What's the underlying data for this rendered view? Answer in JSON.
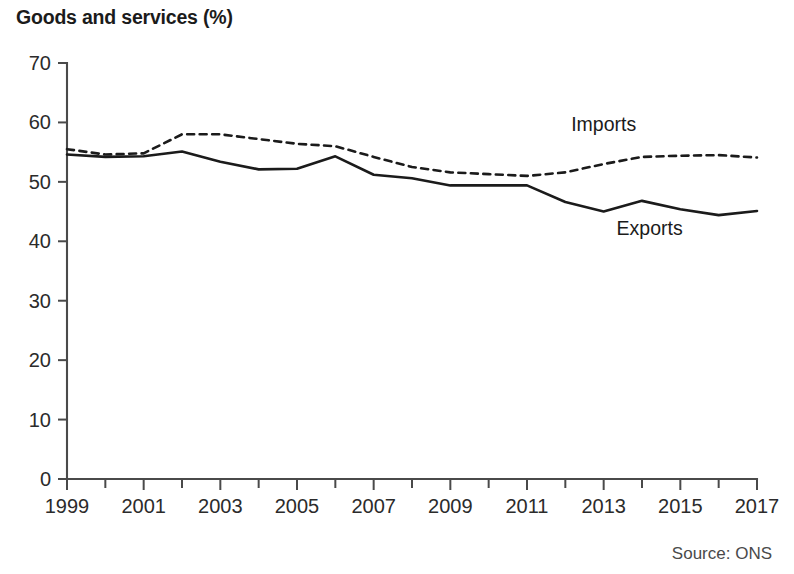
{
  "chart_data": {
    "type": "line",
    "title": "Goods and services (%)",
    "subtitle": "",
    "xlabel": "",
    "ylabel": "",
    "source": "Source: ONS",
    "grid": false,
    "legend_position": "inline-annotations",
    "xlim": [
      1999,
      2017
    ],
    "ylim": [
      0,
      70
    ],
    "yticks": [
      0,
      10,
      20,
      30,
      40,
      50,
      60,
      70
    ],
    "ytick_labels": [
      "0",
      "10",
      "20",
      "30",
      "40",
      "50",
      "60",
      "70"
    ],
    "x": [
      1999,
      2000,
      2001,
      2002,
      2003,
      2004,
      2005,
      2006,
      2007,
      2008,
      2009,
      2010,
      2011,
      2012,
      2013,
      2014,
      2015,
      2016,
      2017
    ],
    "xticks_major": [
      1999,
      2001,
      2003,
      2005,
      2007,
      2009,
      2011,
      2013,
      2015,
      2017
    ],
    "xtick_labels": [
      "1999",
      "2001",
      "2003",
      "2005",
      "2007",
      "2009",
      "2011",
      "2013",
      "2015",
      "2017"
    ],
    "xticks_minor": [
      2000,
      2002,
      2004,
      2006,
      2008,
      2010,
      2012,
      2014,
      2016
    ],
    "series": [
      {
        "name": "Imports",
        "style": "dashed",
        "color": "#1b1b1b",
        "label_text": "Imports",
        "values": [
          55.5,
          54.6,
          54.8,
          58.0,
          58.0,
          57.2,
          56.4,
          56.0,
          54.2,
          52.5,
          51.6,
          51.3,
          51.0,
          51.6,
          53.0,
          54.2,
          54.4,
          54.5,
          54.1
        ]
      },
      {
        "name": "Exports",
        "style": "solid",
        "color": "#1b1b1b",
        "label_text": "Exports",
        "values": [
          54.6,
          54.2,
          54.3,
          55.1,
          53.4,
          52.1,
          52.2,
          54.3,
          51.2,
          50.6,
          49.4,
          49.4,
          49.4,
          46.6,
          45.0,
          46.8,
          45.4,
          44.4,
          45.1
        ]
      }
    ],
    "annotations": [
      {
        "text": "Imports",
        "x_value": 2013.0,
        "y_value": 58.6
      },
      {
        "text": "Exports",
        "x_value": 2014.2,
        "y_value": 41.0
      }
    ]
  }
}
